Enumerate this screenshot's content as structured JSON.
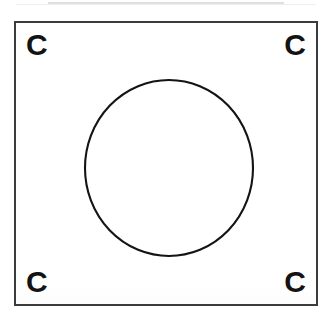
{
  "page": {
    "background_color": "#ffffff",
    "width": 332,
    "height": 317
  },
  "artifact": {
    "name": "scan-line",
    "color": "#d8d9db"
  },
  "frame": {
    "name": "registration-frame",
    "border_color": "#3a3c40",
    "border_width_px": 2,
    "fill_color": "#ffffff",
    "left": 14,
    "top": 21,
    "width": 304,
    "height": 285
  },
  "corner_marks": [
    {
      "position": "top-left",
      "label": "C"
    },
    {
      "position": "top-right",
      "label": "C"
    },
    {
      "position": "bottom-left",
      "label": "C"
    },
    {
      "position": "bottom-right",
      "label": "C"
    }
  ],
  "circle": {
    "name": "center-circle",
    "stroke_color": "#141414",
    "stroke_width_px": 2,
    "fill": "none",
    "center_x": 153,
    "center_y": 145,
    "radius_x": 84,
    "radius_y": 88
  }
}
